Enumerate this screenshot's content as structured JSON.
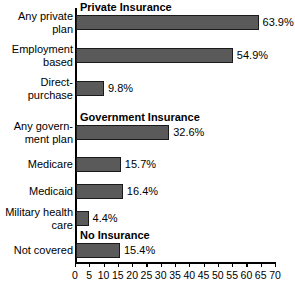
{
  "chart_data": {
    "type": "bar",
    "orientation": "horizontal",
    "title": "",
    "xlabel": "",
    "ylabel": "",
    "xlim": [
      0,
      70
    ],
    "xticks": [
      0,
      5,
      10,
      15,
      20,
      25,
      30,
      35,
      40,
      45,
      50,
      55,
      60,
      65,
      70
    ],
    "grid": false,
    "legend": false,
    "value_suffix": "%",
    "sections": [
      {
        "header": "Private Insurance",
        "categories": [
          "Any private plan",
          "Employment based",
          "Direct-purchase"
        ],
        "values": [
          63.9,
          54.9,
          9.8
        ]
      },
      {
        "header": "Government Insurance",
        "categories": [
          "Any government plan",
          "Medicare",
          "Medicaid",
          "Military health care"
        ],
        "values": [
          32.6,
          15.7,
          16.4,
          4.4
        ]
      },
      {
        "header": "No Insurance",
        "categories": [
          "Not covered"
        ],
        "values": [
          15.4
        ]
      }
    ],
    "categories": [
      "Any private plan",
      "Employment based",
      "Direct-purchase",
      "Any government plan",
      "Medicare",
      "Medicaid",
      "Military health care",
      "Not covered"
    ],
    "values": [
      63.9,
      54.9,
      9.8,
      32.6,
      15.7,
      16.4,
      4.4,
      15.4
    ],
    "colors": {
      "bar_fill": "#5a5a5a",
      "bar_stroke": "#1a1a1a",
      "axis": "#000000",
      "text": "#000000",
      "background": "#ffffff"
    }
  },
  "bars": [
    {
      "label_line1": "Any private",
      "label_line2": "plan",
      "value_text": "63.9%",
      "value": 63.9,
      "top": 15
    },
    {
      "label_line1": "Employment",
      "label_line2": "based",
      "value_text": "54.9%",
      "value": 54.9,
      "top": 48
    },
    {
      "label_line1": "Direct-",
      "label_line2": "purchase",
      "value_text": "9.8%",
      "value": 9.8,
      "top": 81
    },
    {
      "label_line1": "Any govern-",
      "label_line2": "ment plan",
      "value_text": "32.6%",
      "value": 32.6,
      "top": 125
    },
    {
      "label_line1": "Medicare",
      "label_line2": "",
      "value_text": "15.7%",
      "value": 15.7,
      "top": 157
    },
    {
      "label_line1": "Medicaid",
      "label_line2": "",
      "value_text": "16.4%",
      "value": 16.4,
      "top": 184
    },
    {
      "label_line1": "Military health",
      "label_line2": "care",
      "value_text": "4.4%",
      "value": 4.4,
      "top": 211
    },
    {
      "label_line1": "Not covered",
      "label_line2": "",
      "value_text": "15.4%",
      "value": 15.4,
      "top": 243
    }
  ],
  "headers": [
    {
      "text": "Private Insurance",
      "top": 1
    },
    {
      "text": "Government Insurance",
      "top": 111
    },
    {
      "text": "No Insurance",
      "top": 229
    }
  ],
  "ticks": [
    {
      "label": "0",
      "value": 0
    },
    {
      "label": "5",
      "value": 5
    },
    {
      "label": "10",
      "value": 10
    },
    {
      "label": "15",
      "value": 15
    },
    {
      "label": "20",
      "value": 20
    },
    {
      "label": "25",
      "value": 25
    },
    {
      "label": "30",
      "value": 30
    },
    {
      "label": "35",
      "value": 35
    },
    {
      "label": "40",
      "value": 40
    },
    {
      "label": "45",
      "value": 45
    },
    {
      "label": "50",
      "value": 50
    },
    {
      "label": "55",
      "value": 55
    },
    {
      "label": "60",
      "value": 60
    },
    {
      "label": "65",
      "value": 65
    },
    {
      "label": "70",
      "value": 70
    }
  ]
}
